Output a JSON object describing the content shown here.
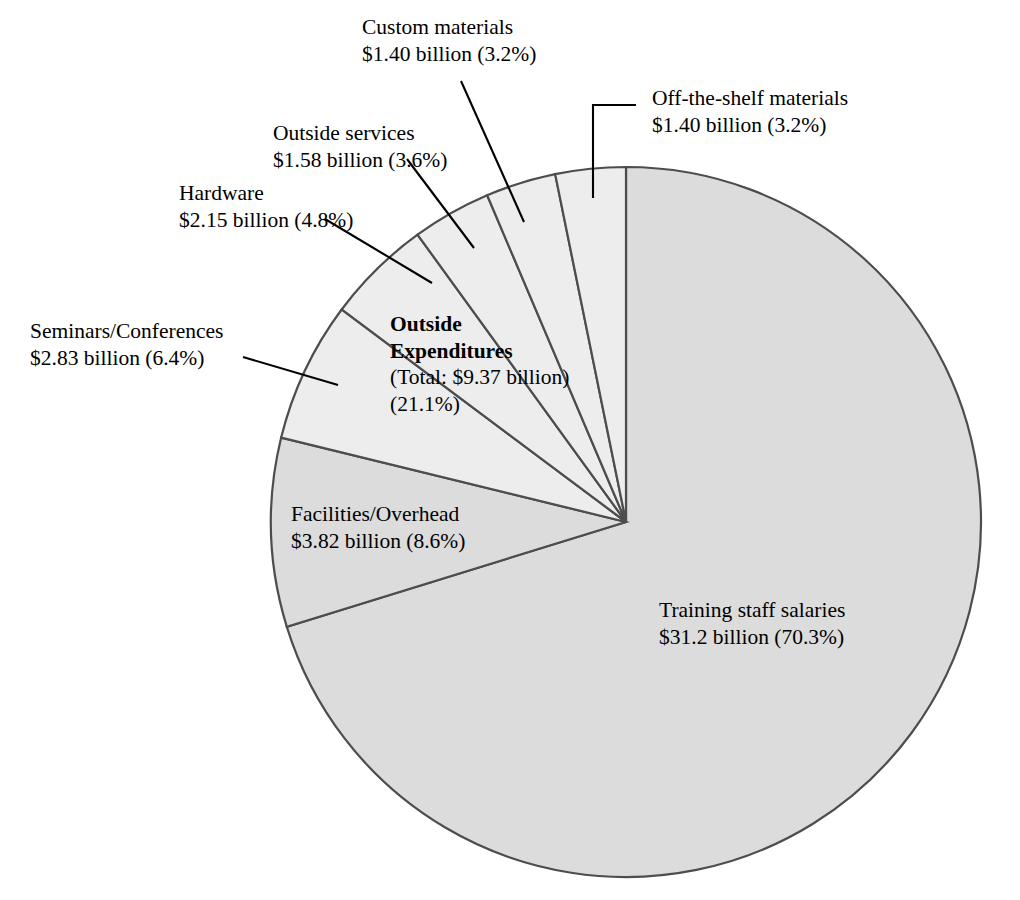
{
  "chart_data": {
    "type": "pie",
    "title": "",
    "subtitle": "",
    "xlabel": "",
    "ylabel": "",
    "legend_position": "none",
    "grid": false,
    "units": "billion USD",
    "total_label": "Outside Expenditures",
    "total_value_text": "(Total: $9.37 billion)",
    "total_percent_text": "(21.1%)",
    "start_angle_deg": 0,
    "direction": "clockwise",
    "categories": [
      "Training staff salaries",
      "Facilities/Overhead",
      "Seminars/Conferences",
      "Hardware",
      "Outside services",
      "Custom materials",
      "Off-the-shelf materials"
    ],
    "values": [
      31.2,
      3.82,
      2.83,
      2.15,
      1.58,
      1.4,
      1.4
    ],
    "percents": [
      70.3,
      8.6,
      6.4,
      4.8,
      3.6,
      3.2,
      3.2
    ],
    "slices": [
      {
        "name": "Training staff salaries",
        "value": 31.2,
        "value_text": "$31.2 billion",
        "percent": 70.3,
        "percent_text": "(70.3%)",
        "group": "internal",
        "fill": "#dcdcdc"
      },
      {
        "name": "Facilities/Overhead",
        "value": 3.82,
        "value_text": "$3.82 billion",
        "percent": 8.6,
        "percent_text": "(8.6%)",
        "group": "internal",
        "fill": "#dcdcdc"
      },
      {
        "name": "Seminars/Conferences",
        "value": 2.83,
        "value_text": "$2.83 billion",
        "percent": 6.4,
        "percent_text": "(6.4%)",
        "group": "outside",
        "fill": "#ededed"
      },
      {
        "name": "Hardware",
        "value": 2.15,
        "value_text": "$2.15 billion",
        "percent": 4.8,
        "percent_text": "(4.8%)",
        "group": "outside",
        "fill": "#ededed"
      },
      {
        "name": "Outside services",
        "value": 1.58,
        "value_text": "$1.58 billion",
        "percent": 3.6,
        "percent_text": "(3.6%)",
        "group": "outside",
        "fill": "#ededed"
      },
      {
        "name": "Custom materials",
        "value": 1.4,
        "value_text": "$1.40 billion",
        "percent": 3.2,
        "percent_text": "(3.2%)",
        "group": "outside",
        "fill": "#ededed"
      },
      {
        "name": "Off-the-shelf materials",
        "value": 1.4,
        "value_text": "$1.40 billion",
        "percent": 3.2,
        "percent_text": "(3.2%)",
        "group": "outside",
        "fill": "#ededed"
      }
    ]
  },
  "labels": {
    "custom_materials": {
      "line1": "Custom materials",
      "line2": "$1.40 billion (3.2%)"
    },
    "off_the_shelf": {
      "line1": "Off-the-shelf materials",
      "line2": "$1.40 billion (3.2%)"
    },
    "outside_services": {
      "line1": "Outside services",
      "line2": "$1.58 billion (3.6%)"
    },
    "hardware": {
      "line1": "Hardware",
      "line2": "$2.15 billion (4.8%)"
    },
    "seminars": {
      "line1": "Seminars/Conferences",
      "line2": "$2.83 billion (6.4%)"
    },
    "facilities": {
      "line1": "Facilities/Overhead",
      "line2": "$3.82 billion (8.6%)"
    },
    "training_staff": {
      "line1": "Training staff salaries",
      "line2": "$31.2 billion (70.3%)"
    },
    "outside_expenditures": {
      "line1": "Outside",
      "line2": "Expenditures",
      "line3": "(Total: $9.37 billion)",
      "line4": "(21.1%)"
    }
  },
  "colors": {
    "slice_internal": "#dcdcdc",
    "slice_outside": "#ededed",
    "outline": "#4d4d4d",
    "leader_line": "#000000",
    "text": "#000000",
    "background": "#ffffff"
  }
}
